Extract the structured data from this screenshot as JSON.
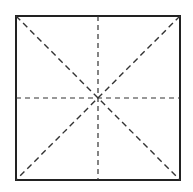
{
  "diagram": {
    "square": {
      "x": 16,
      "y": 16,
      "size": 164,
      "stroke": "#222222",
      "stroke_width": 2
    },
    "fold_lines": [
      {
        "name": "diagonal-tl-br",
        "x1": 16,
        "y1": 16,
        "x2": 180,
        "y2": 180
      },
      {
        "name": "diagonal-tr-bl",
        "x1": 180,
        "y1": 16,
        "x2": 16,
        "y2": 180
      },
      {
        "name": "vertical-midline",
        "x1": 98,
        "y1": 16,
        "x2": 98,
        "y2": 180
      },
      {
        "name": "horizontal-midline",
        "x1": 16,
        "y1": 98,
        "x2": 180,
        "y2": 98
      }
    ],
    "dash_color": "#333333",
    "center": {
      "x": 98,
      "y": 98
    }
  }
}
